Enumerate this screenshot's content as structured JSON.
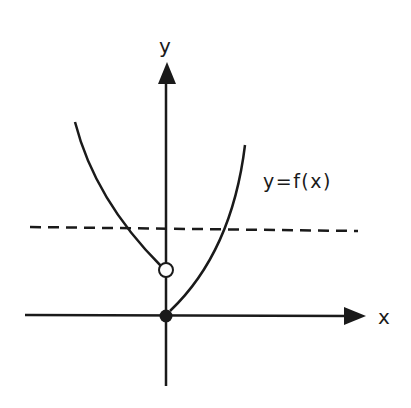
{
  "diagram": {
    "type": "function-graph",
    "axes": {
      "x_label": "x",
      "y_label": "y"
    },
    "curve_label": "y=f(x)",
    "curves": [
      {
        "name": "left-branch",
        "description": "decreasing branch ending at open circle on y-axis"
      },
      {
        "name": "right-branch",
        "description": "increasing branch starting at filled dot at origin"
      }
    ],
    "points": [
      {
        "name": "open-circle",
        "kind": "open",
        "location": "on y-axis above origin"
      },
      {
        "name": "origin-dot",
        "kind": "filled",
        "location": "origin"
      }
    ],
    "reference_line": {
      "style": "dashed",
      "orientation": "horizontal"
    },
    "colors": {
      "stroke": "#1a1a1a",
      "background": "#ffffff"
    }
  }
}
